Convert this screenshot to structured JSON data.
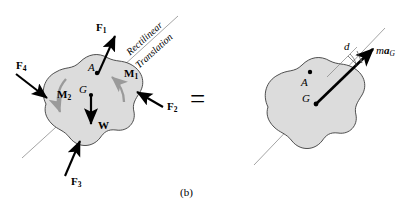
{
  "figure": {
    "caption": "(b)",
    "equals_sign": "=",
    "axis_annotation_line1": "Rectilinear",
    "axis_annotation_line2": "Translation",
    "colors": {
      "body_fill": "#dcdcdc",
      "body_outline": "#3c3c3c",
      "axis_line": "#8c8c8c",
      "force_arrow": "#000000",
      "couple_arrow": "#9a9a9a",
      "background": "#ffffff"
    }
  },
  "left_diagram": {
    "name": "free-body-diagram",
    "points": [
      {
        "id": "A",
        "label": "A",
        "description": "arbitrary point on body"
      },
      {
        "id": "G",
        "label": "G",
        "description": "center of mass"
      }
    ],
    "forces": [
      {
        "id": "F1",
        "label": "F",
        "subscript": "1",
        "direction": "up-right",
        "applied_at": "A"
      },
      {
        "id": "F2",
        "label": "F",
        "subscript": "2",
        "direction": "up-left",
        "applied_at": "right edge"
      },
      {
        "id": "F3",
        "label": "F",
        "subscript": "3",
        "direction": "up-right",
        "applied_at": "bottom edge"
      },
      {
        "id": "F4",
        "label": "F",
        "subscript": "4",
        "direction": "down-right",
        "applied_at": "left edge"
      },
      {
        "id": "W",
        "label": "W",
        "subscript": "",
        "direction": "down",
        "applied_at": "G"
      }
    ],
    "couples": [
      {
        "id": "M1",
        "label": "M",
        "subscript": "1",
        "sense": "counterclockwise"
      },
      {
        "id": "M2",
        "label": "M",
        "subscript": "2",
        "sense": "clockwise"
      }
    ]
  },
  "right_diagram": {
    "name": "kinetic-diagram",
    "points": [
      {
        "id": "A",
        "label": "A",
        "description": "arbitrary point on body"
      },
      {
        "id": "G",
        "label": "G",
        "description": "center of mass"
      }
    ],
    "vector": {
      "id": "maG",
      "label_m": "m",
      "label_a": "a",
      "label_sub": "G",
      "origin": "G",
      "direction": "up-right"
    },
    "dimension": {
      "id": "d",
      "label": "d",
      "description": "perpendicular distance from A to line of action of maG"
    }
  }
}
